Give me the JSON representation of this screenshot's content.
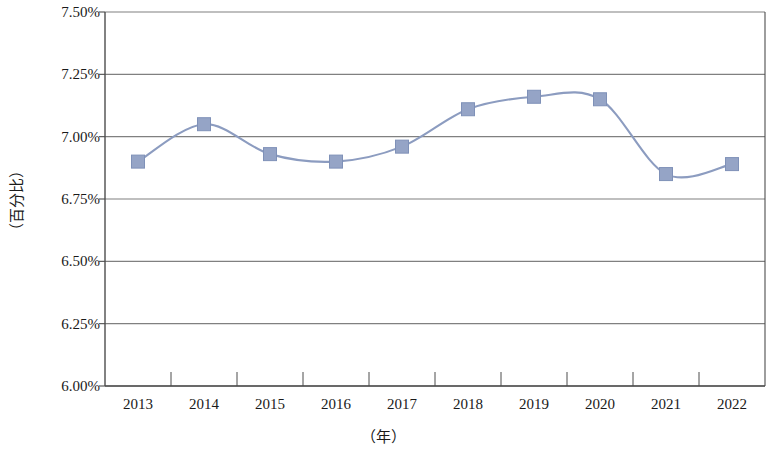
{
  "chart_data": {
    "type": "line",
    "title": "",
    "xlabel": "（年）",
    "ylabel": "（百分比）",
    "categories": [
      "2013",
      "2014",
      "2015",
      "2016",
      "2017",
      "2018",
      "2019",
      "2020",
      "2021",
      "2022"
    ],
    "series": [
      {
        "name": "",
        "values": [
          6.9,
          7.05,
          6.93,
          6.9,
          6.96,
          7.11,
          7.16,
          7.15,
          6.85,
          6.89
        ]
      }
    ],
    "value_suffix": "%",
    "ylim": [
      6.0,
      7.5
    ],
    "ytick_step": 0.25,
    "ytick_labels": [
      "7.50%",
      "7.25%",
      "7.00%",
      "6.75%",
      "6.50%",
      "6.25%",
      "6.00%"
    ],
    "ytick_values": [
      7.5,
      7.25,
      7.0,
      6.75,
      6.5,
      6.25,
      6.0
    ],
    "grid": "horizontal",
    "legend": "none",
    "marker": "square",
    "line_smooth": true,
    "colors": {
      "line": "#8c9cc0",
      "marker_fill": "#95a4c6",
      "marker_stroke": "#7f91b8",
      "grid": "#808080",
      "axis": "#4d4d4d",
      "text": "#1a1a1a",
      "background": "#ffffff"
    }
  }
}
